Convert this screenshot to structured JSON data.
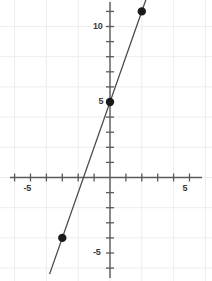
{
  "chart_data": {
    "type": "line",
    "title": "",
    "xlabel": "",
    "ylabel": "",
    "xlim": [
      -6.9,
      6.4
    ],
    "ylim": [
      -6.9,
      11.7
    ],
    "grid": true,
    "grid_step": 2,
    "tick_step": 1,
    "legend": "none",
    "line": {
      "name": "y = 3x + 5",
      "slope": 3,
      "intercept": 5,
      "color": "#4a4a4a",
      "x_start": -3.8,
      "y_start": -6.4,
      "x_end": 2.3,
      "y_end": 11.9
    },
    "points": [
      {
        "x": -3,
        "y": -4,
        "color": "#1a1a1a"
      },
      {
        "x": 0,
        "y": 5,
        "color": "#1a1a1a"
      },
      {
        "x": 2,
        "y": 11,
        "color": "#1a1a1a"
      }
    ],
    "x_tick_labels": [
      {
        "value": -5,
        "text": "-5"
      },
      {
        "value": 5,
        "text": "5"
      }
    ],
    "y_tick_labels": [
      {
        "value": 10,
        "text": "10"
      },
      {
        "value": 5,
        "text": "5"
      },
      {
        "value": -5,
        "text": "-5"
      }
    ],
    "axis_color": "#5a5a5a",
    "grid_color": "#ededf2"
  }
}
